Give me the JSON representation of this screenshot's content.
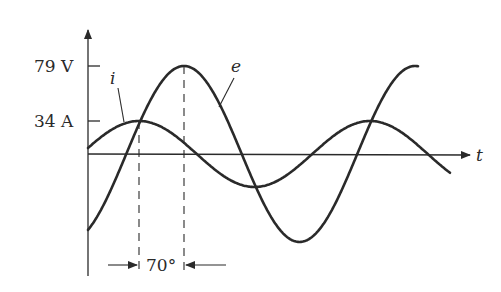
{
  "figure": {
    "y_tick_labels": [
      "79 V",
      "34 A"
    ],
    "curve_labels": {
      "current": "i",
      "voltage": "e"
    },
    "time_axis_label": "t",
    "phase_annotation": "70°"
  },
  "chart_data": {
    "type": "line",
    "title": "",
    "xlabel": "t",
    "ylabel": "",
    "series": [
      {
        "name": "e",
        "amplitude": 79,
        "unit": "V",
        "phase_lead_deg": 0
      },
      {
        "name": "i",
        "amplitude": 34,
        "unit": "A",
        "phase_lead_deg": 70
      }
    ],
    "annotations": [
      "i leads e by 70°"
    ],
    "grid": false
  },
  "colors": {
    "ink": "#2a2a2a",
    "background": "#ffffff"
  }
}
